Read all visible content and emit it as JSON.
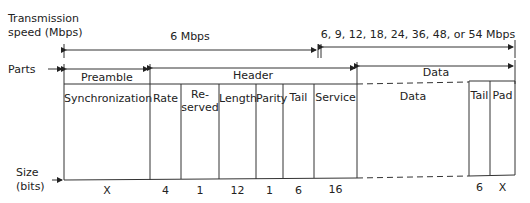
{
  "axis_labels": {
    "speed_line1": "Transmission",
    "speed_line2": "speed (Mbps)",
    "parts": "Parts",
    "size_line1": "Size",
    "size_line2": "(bits)"
  },
  "speeds": {
    "header_speed": "6 Mbps",
    "data_speed": "6, 9, 12, 18, 24, 36, 48, or 54 Mbps"
  },
  "parts": {
    "preamble": "Preamble",
    "header": "Header",
    "data": "Data"
  },
  "fields": [
    {
      "name": "Synchronization",
      "bits": "X"
    },
    {
      "name": "Rate",
      "bits": "4"
    },
    {
      "name_line1": "Re-",
      "name_line2": "served",
      "bits": "1"
    },
    {
      "name": "Length",
      "bits": "12"
    },
    {
      "name": "Parity",
      "bits": "1"
    },
    {
      "name": "Tail",
      "bits": "6"
    },
    {
      "name": "Service",
      "bits": "16"
    },
    {
      "name": "Data",
      "bits": ""
    },
    {
      "name": "Tail",
      "bits": "6"
    },
    {
      "name": "Pad",
      "bits": "X"
    }
  ]
}
